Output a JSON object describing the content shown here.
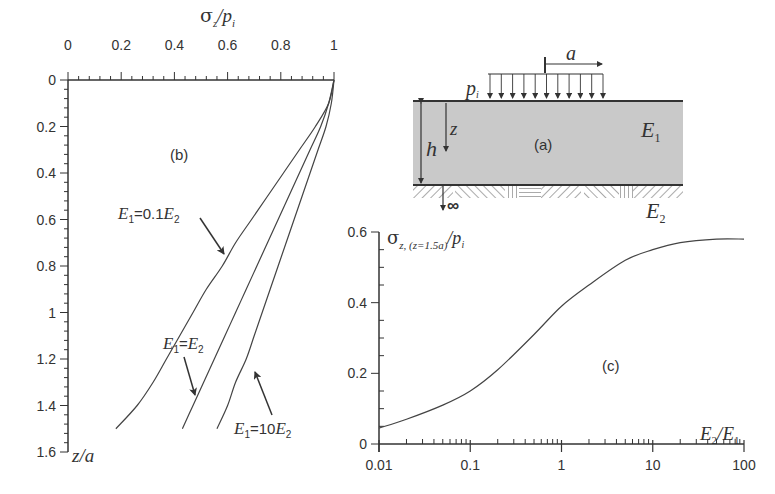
{
  "figure": {
    "panel_b_label": "(b)",
    "panel_a_label": "(a)",
    "panel_c_label": "(c)"
  },
  "chart_data": [
    {
      "id": "b",
      "type": "line",
      "title": "(b)",
      "xlabel": "σz/pi",
      "ylabel": "z/a",
      "xlim": [
        0,
        1
      ],
      "ylim": [
        0,
        1.6
      ],
      "y_inverted": true,
      "x_axis_position": "top",
      "xticks": [
        "0",
        "0.2",
        "0.4",
        "0.6",
        "0.8",
        "1"
      ],
      "yticks": [
        "0",
        "0.2",
        "0.4",
        "0.6",
        "0.8",
        "1",
        "1.2",
        "1.4",
        "1.6"
      ],
      "grid": false,
      "series": [
        {
          "name": "E1=0.1E2",
          "label_parts": [
            "E",
            "1",
            "=0.1",
            "E",
            "2"
          ],
          "points": [
            [
              1.0,
              0.0
            ],
            [
              0.98,
              0.1
            ],
            [
              0.93,
              0.2
            ],
            [
              0.87,
              0.3
            ],
            [
              0.81,
              0.4
            ],
            [
              0.75,
              0.5
            ],
            [
              0.69,
              0.6
            ],
            [
              0.63,
              0.7
            ],
            [
              0.58,
              0.8
            ],
            [
              0.52,
              0.9
            ],
            [
              0.47,
              1.0
            ],
            [
              0.42,
              1.1
            ],
            [
              0.37,
              1.2
            ],
            [
              0.32,
              1.3
            ],
            [
              0.26,
              1.4
            ],
            [
              0.18,
              1.5
            ]
          ]
        },
        {
          "name": "E1=E2",
          "label_parts": [
            "E",
            "1",
            "=",
            "E",
            "2"
          ],
          "points": [
            [
              1.0,
              0.0
            ],
            [
              0.98,
              0.1
            ],
            [
              0.95,
              0.2
            ],
            [
              0.91,
              0.3
            ],
            [
              0.87,
              0.4
            ],
            [
              0.83,
              0.5
            ],
            [
              0.79,
              0.6
            ],
            [
              0.75,
              0.7
            ],
            [
              0.71,
              0.8
            ],
            [
              0.67,
              0.9
            ],
            [
              0.63,
              1.0
            ],
            [
              0.59,
              1.1
            ],
            [
              0.55,
              1.2
            ],
            [
              0.51,
              1.3
            ],
            [
              0.47,
              1.4
            ],
            [
              0.43,
              1.5
            ]
          ]
        },
        {
          "name": "E1=10E2",
          "label_parts": [
            "E",
            "1",
            "=10",
            "E",
            "2"
          ],
          "points": [
            [
              1.0,
              0.0
            ],
            [
              0.99,
              0.1
            ],
            [
              0.97,
              0.2
            ],
            [
              0.94,
              0.3
            ],
            [
              0.91,
              0.4
            ],
            [
              0.88,
              0.5
            ],
            [
              0.85,
              0.6
            ],
            [
              0.82,
              0.7
            ],
            [
              0.79,
              0.8
            ],
            [
              0.76,
              0.9
            ],
            [
              0.73,
              1.0
            ],
            [
              0.7,
              1.1
            ],
            [
              0.67,
              1.2
            ],
            [
              0.63,
              1.3
            ],
            [
              0.6,
              1.4
            ],
            [
              0.56,
              1.5
            ]
          ]
        }
      ]
    },
    {
      "id": "a",
      "type": "diagram",
      "title": "(a)",
      "labels": {
        "load": "p",
        "load_sub": "i",
        "radius": "a",
        "thickness": "h",
        "depth": "z",
        "layer1": "E",
        "layer1_sub": "1",
        "layer2": "E",
        "layer2_sub": "2",
        "infinity": "∞"
      }
    },
    {
      "id": "c",
      "type": "line",
      "title": "(c)",
      "xlabel": "E2/E1",
      "ylabel": "σz, (z=1.5a)/pi",
      "xscale": "log",
      "xlim": [
        0.01,
        100
      ],
      "ylim": [
        0,
        0.6
      ],
      "xticks": [
        "0.01",
        "0.1",
        "1",
        "10",
        "100"
      ],
      "yticks": [
        "0",
        "0.2",
        "0.4",
        "0.6"
      ],
      "grid": false,
      "series": [
        {
          "name": "σz(z=1.5a)/pi",
          "points": [
            [
              0.01,
              0.045
            ],
            [
              0.02,
              0.07
            ],
            [
              0.05,
              0.11
            ],
            [
              0.1,
              0.15
            ],
            [
              0.2,
              0.21
            ],
            [
              0.5,
              0.31
            ],
            [
              1,
              0.39
            ],
            [
              2,
              0.45
            ],
            [
              5,
              0.52
            ],
            [
              10,
              0.55
            ],
            [
              20,
              0.57
            ],
            [
              50,
              0.58
            ],
            [
              100,
              0.58
            ]
          ]
        }
      ]
    }
  ]
}
